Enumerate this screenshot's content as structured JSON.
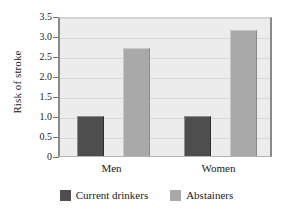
{
  "chart_data": {
    "type": "bar",
    "title": "",
    "xlabel": "",
    "ylabel": "Risk of stroke",
    "categories": [
      "Men",
      "Women"
    ],
    "series": [
      {
        "name": "Current drinkers",
        "color": "#4e4e4e",
        "values": [
          1.0,
          1.0
        ]
      },
      {
        "name": "Abstainers",
        "color": "#a9a9a9",
        "values": [
          2.7,
          3.15
        ]
      }
    ],
    "ylim": [
      0,
      3.5
    ],
    "yticks": [
      0,
      0.5,
      1.0,
      1.5,
      2.0,
      2.5,
      3.0,
      3.5
    ],
    "ytick_labels": [
      "0",
      "0.5",
      "1.0",
      "1.5",
      "2.0",
      "2.5",
      "3.0",
      "3.5"
    ],
    "grid": true,
    "legend_position": "bottom",
    "plot_background": "#ececec"
  },
  "legend": {
    "items": [
      {
        "label": "Current drinkers",
        "swatch": "dark"
      },
      {
        "label": "Abstainers",
        "swatch": "light"
      }
    ]
  }
}
